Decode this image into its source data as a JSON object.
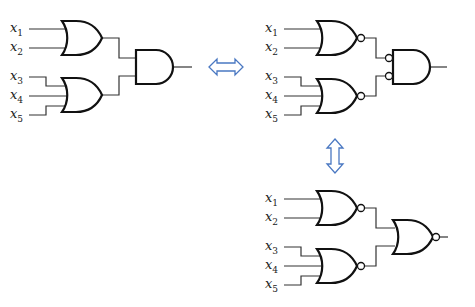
{
  "diagram": {
    "title": "",
    "equivalence_arrows": [
      {
        "direction": "horizontal",
        "between": [
          "or-and-circuit",
          "nor-and-inverted-circuit"
        ]
      },
      {
        "direction": "vertical",
        "between": [
          "nor-and-inverted-circuit",
          "nor-nor-circuit"
        ]
      }
    ],
    "circuits": [
      {
        "id": "or-and-circuit",
        "inputs": [
          {
            "var": "x",
            "sub": "1"
          },
          {
            "var": "x",
            "sub": "2"
          },
          {
            "var": "x",
            "sub": "3"
          },
          {
            "var": "x",
            "sub": "4"
          },
          {
            "var": "x",
            "sub": "5"
          }
        ],
        "first_level": [
          "OR",
          "OR"
        ],
        "second_level": "AND"
      },
      {
        "id": "nor-and-inverted-circuit",
        "inputs": [
          {
            "var": "x",
            "sub": "1"
          },
          {
            "var": "x",
            "sub": "2"
          },
          {
            "var": "x",
            "sub": "3"
          },
          {
            "var": "x",
            "sub": "4"
          },
          {
            "var": "x",
            "sub": "5"
          }
        ],
        "first_level": [
          "NOR",
          "NOR"
        ],
        "second_level": "AND with inverted inputs"
      },
      {
        "id": "nor-nor-circuit",
        "inputs": [
          {
            "var": "x",
            "sub": "1"
          },
          {
            "var": "x",
            "sub": "2"
          },
          {
            "var": "x",
            "sub": "3"
          },
          {
            "var": "x",
            "sub": "4"
          },
          {
            "var": "x",
            "sub": "5"
          }
        ],
        "first_level": [
          "NOR",
          "NOR"
        ],
        "second_level": "NOR"
      }
    ],
    "colors": {
      "arrow": "#4a78c2",
      "lines": "#111111"
    }
  }
}
